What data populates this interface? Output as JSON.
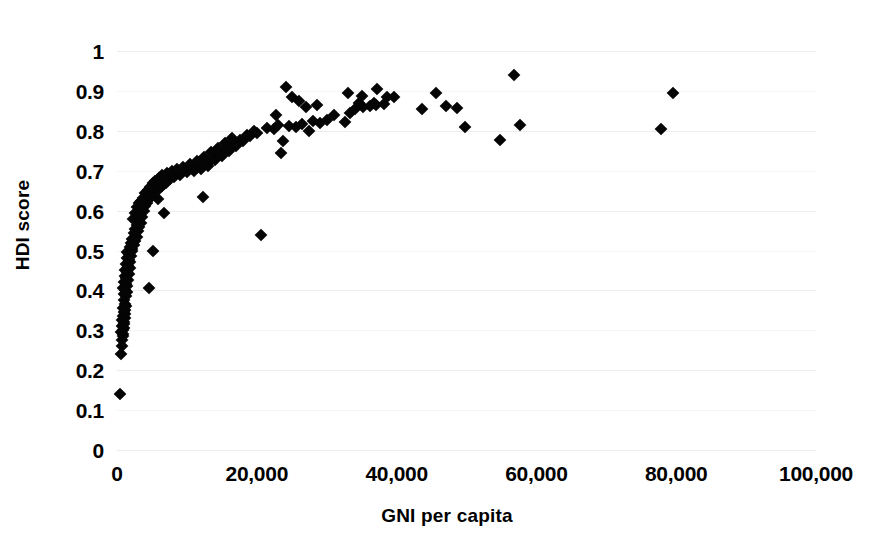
{
  "chart_data": {
    "type": "scatter",
    "title": "",
    "xlabel": "GNI per capita",
    "ylabel": "HDI score",
    "xlim": [
      0,
      100000
    ],
    "ylim": [
      0,
      1
    ],
    "grid": true,
    "legend": "none",
    "marker": "diamond",
    "marker_color": "#050505",
    "xticks": [
      0,
      20000,
      40000,
      60000,
      80000,
      100000
    ],
    "xticklabels": [
      "0",
      "20,000",
      "40,000",
      "60,000",
      "80,000",
      "100,000"
    ],
    "yticks": [
      0,
      0.1,
      0.2,
      0.3,
      0.4,
      0.5,
      0.6,
      0.7,
      0.8,
      0.9,
      1
    ],
    "yticklabels": [
      "0",
      "0.1",
      "0.2",
      "0.3",
      "0.4",
      "0.5",
      "0.6",
      "0.7",
      "0.8",
      "0.9",
      "1"
    ],
    "points": [
      [
        400,
        0.14
      ],
      [
        600,
        0.24
      ],
      [
        700,
        0.26
      ],
      [
        750,
        0.275
      ],
      [
        800,
        0.285
      ],
      [
        850,
        0.29
      ],
      [
        620,
        0.295
      ],
      [
        900,
        0.3
      ],
      [
        950,
        0.305
      ],
      [
        700,
        0.31
      ],
      [
        1000,
        0.315
      ],
      [
        1050,
        0.32
      ],
      [
        780,
        0.325
      ],
      [
        1100,
        0.33
      ],
      [
        900,
        0.335
      ],
      [
        1150,
        0.34
      ],
      [
        1000,
        0.345
      ],
      [
        1200,
        0.35
      ],
      [
        850,
        0.355
      ],
      [
        1250,
        0.36
      ],
      [
        1100,
        0.365
      ],
      [
        950,
        0.375
      ],
      [
        1300,
        0.385
      ],
      [
        1050,
        0.39
      ],
      [
        1400,
        0.395
      ],
      [
        1150,
        0.4
      ],
      [
        900,
        0.405
      ],
      [
        1500,
        0.41
      ],
      [
        1250,
        0.415
      ],
      [
        1000,
        0.42
      ],
      [
        1600,
        0.425
      ],
      [
        1350,
        0.43
      ],
      [
        1100,
        0.435
      ],
      [
        1700,
        0.44
      ],
      [
        1450,
        0.445
      ],
      [
        1200,
        0.45
      ],
      [
        1800,
        0.455
      ],
      [
        1550,
        0.46
      ],
      [
        1300,
        0.465
      ],
      [
        1900,
        0.47
      ],
      [
        1650,
        0.475
      ],
      [
        1400,
        0.48
      ],
      [
        2000,
        0.485
      ],
      [
        1750,
        0.49
      ],
      [
        1500,
        0.495
      ],
      [
        2100,
        0.5
      ],
      [
        4600,
        0.405
      ],
      [
        5100,
        0.5
      ],
      [
        2200,
        0.505
      ],
      [
        1900,
        0.51
      ],
      [
        2400,
        0.515
      ],
      [
        2050,
        0.52
      ],
      [
        2600,
        0.525
      ],
      [
        2200,
        0.53
      ],
      [
        20600,
        0.54
      ],
      [
        2800,
        0.535
      ],
      [
        2400,
        0.545
      ],
      [
        3000,
        0.55
      ],
      [
        2600,
        0.555
      ],
      [
        3200,
        0.56
      ],
      [
        2800,
        0.565
      ],
      [
        3400,
        0.57
      ],
      [
        3000,
        0.575
      ],
      [
        2300,
        0.58
      ],
      [
        3600,
        0.585
      ],
      [
        3200,
        0.59
      ],
      [
        2600,
        0.595
      ],
      [
        6700,
        0.595
      ],
      [
        3800,
        0.6
      ],
      [
        3400,
        0.605
      ],
      [
        2900,
        0.61
      ],
      [
        4000,
        0.612
      ],
      [
        3600,
        0.615
      ],
      [
        3200,
        0.618
      ],
      [
        4300,
        0.62
      ],
      [
        3800,
        0.622
      ],
      [
        3400,
        0.625
      ],
      [
        4600,
        0.628
      ],
      [
        4000,
        0.63
      ],
      [
        5900,
        0.63
      ],
      [
        3700,
        0.632
      ],
      [
        4900,
        0.635
      ],
      [
        4300,
        0.638
      ],
      [
        12300,
        0.635
      ],
      [
        5200,
        0.64
      ],
      [
        4600,
        0.643
      ],
      [
        4000,
        0.645
      ],
      [
        5600,
        0.648
      ],
      [
        4900,
        0.65
      ],
      [
        4400,
        0.652
      ],
      [
        6000,
        0.655
      ],
      [
        5300,
        0.658
      ],
      [
        4700,
        0.66
      ],
      [
        6500,
        0.662
      ],
      [
        5700,
        0.665
      ],
      [
        5100,
        0.668
      ],
      [
        7000,
        0.67
      ],
      [
        6200,
        0.672
      ],
      [
        5500,
        0.675
      ],
      [
        7600,
        0.678
      ],
      [
        6700,
        0.68
      ],
      [
        6000,
        0.682
      ],
      [
        8200,
        0.685
      ],
      [
        7300,
        0.688
      ],
      [
        6500,
        0.69
      ],
      [
        9000,
        0.69
      ],
      [
        8000,
        0.692
      ],
      [
        7100,
        0.695
      ],
      [
        10000,
        0.697
      ],
      [
        8800,
        0.698
      ],
      [
        7800,
        0.7
      ],
      [
        11000,
        0.7
      ],
      [
        9700,
        0.702
      ],
      [
        8600,
        0.705
      ],
      [
        12000,
        0.705
      ],
      [
        10600,
        0.708
      ],
      [
        9500,
        0.71
      ],
      [
        13000,
        0.712
      ],
      [
        11600,
        0.715
      ],
      [
        10400,
        0.718
      ],
      [
        12600,
        0.722
      ],
      [
        11400,
        0.725
      ],
      [
        14000,
        0.728
      ],
      [
        13600,
        0.73
      ],
      [
        12400,
        0.734
      ],
      [
        15000,
        0.738
      ],
      [
        14600,
        0.742
      ],
      [
        13400,
        0.746
      ],
      [
        16000,
        0.75
      ],
      [
        15600,
        0.755
      ],
      [
        23400,
        0.745
      ],
      [
        14400,
        0.758
      ],
      [
        17000,
        0.762
      ],
      [
        16600,
        0.766
      ],
      [
        15400,
        0.77
      ],
      [
        18000,
        0.775
      ],
      [
        17600,
        0.778
      ],
      [
        16400,
        0.782
      ],
      [
        19000,
        0.786
      ],
      [
        18600,
        0.79
      ],
      [
        23800,
        0.775
      ],
      [
        20000,
        0.795
      ],
      [
        19600,
        0.8
      ],
      [
        27400,
        0.8
      ],
      [
        22400,
        0.805
      ],
      [
        21400,
        0.808
      ],
      [
        25600,
        0.81
      ],
      [
        24600,
        0.812
      ],
      [
        23000,
        0.815
      ],
      [
        26400,
        0.818
      ],
      [
        29000,
        0.82
      ],
      [
        28000,
        0.825
      ],
      [
        30000,
        0.828
      ],
      [
        32600,
        0.822
      ],
      [
        31000,
        0.84
      ],
      [
        33400,
        0.845
      ],
      [
        34000,
        0.855
      ],
      [
        35200,
        0.86
      ],
      [
        36200,
        0.862
      ],
      [
        37000,
        0.865
      ],
      [
        34600,
        0.87
      ],
      [
        36800,
        0.87
      ],
      [
        38200,
        0.868
      ],
      [
        33000,
        0.895
      ],
      [
        35000,
        0.888
      ],
      [
        37200,
        0.905
      ],
      [
        38600,
        0.884
      ],
      [
        39600,
        0.885
      ],
      [
        24200,
        0.91
      ],
      [
        25000,
        0.885
      ],
      [
        26000,
        0.875
      ],
      [
        27000,
        0.86
      ],
      [
        28600,
        0.865
      ],
      [
        22800,
        0.84
      ],
      [
        43600,
        0.855
      ],
      [
        45600,
        0.895
      ],
      [
        47000,
        0.862
      ],
      [
        48600,
        0.858
      ],
      [
        49800,
        0.81
      ],
      [
        54800,
        0.777
      ],
      [
        56800,
        0.94
      ],
      [
        57600,
        0.815
      ],
      [
        79500,
        0.895
      ],
      [
        77800,
        0.805
      ]
    ]
  }
}
